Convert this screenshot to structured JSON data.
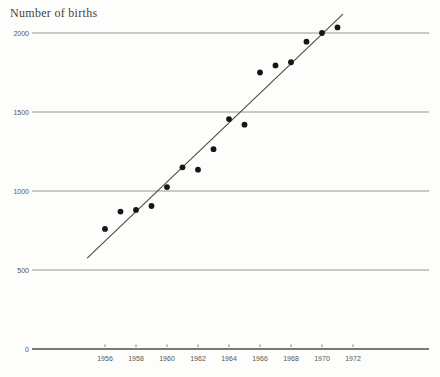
{
  "figure": {
    "background": "#fdfdfb"
  },
  "chart_data": {
    "type": "scatter",
    "title": "Number of births",
    "ylabel": "Number of births",
    "xlabel": "",
    "categories_note": "x axis is calendar year, labeled every 2 years",
    "x_ticks": [
      1956,
      1958,
      1960,
      1962,
      1964,
      1966,
      1968,
      1970,
      1972
    ],
    "y_ticks": [
      0,
      500,
      1000,
      1500,
      2000
    ],
    "ylim": [
      0,
      2000
    ],
    "xlim": [
      1951.3,
      1976.9
    ],
    "grid": "horizontal",
    "legend": "none",
    "series": [
      {
        "name": "births",
        "marker": "filled-circle",
        "points": [
          {
            "year": 1956,
            "value": 760
          },
          {
            "year": 1957,
            "value": 870
          },
          {
            "year": 1958,
            "value": 880
          },
          {
            "year": 1959,
            "value": 905
          },
          {
            "year": 1960,
            "value": 1025
          },
          {
            "year": 1961,
            "value": 1150
          },
          {
            "year": 1962,
            "value": 1135
          },
          {
            "year": 1963,
            "value": 1265
          },
          {
            "year": 1964,
            "value": 1455
          },
          {
            "year": 1965,
            "value": 1420
          },
          {
            "year": 1966,
            "value": 1750
          },
          {
            "year": 1967,
            "value": 1795
          },
          {
            "year": 1968,
            "value": 1815
          },
          {
            "year": 1969,
            "value": 1945
          },
          {
            "year": 1970,
            "value": 2000
          },
          {
            "year": 1971,
            "value": 2035
          }
        ]
      }
    ],
    "trend_line": {
      "start": {
        "year": 1954.85,
        "value": 575
      },
      "end": {
        "year": 1971.35,
        "value": 2120
      }
    },
    "colors": {
      "background": "#fdfdfb",
      "grid": "#98978f",
      "axis": "#7b7a74",
      "tick": "#6f6e68",
      "marker": "#161616",
      "trend": "#4b4a45",
      "title": "#44433c",
      "tick_label": "#57564f"
    }
  }
}
